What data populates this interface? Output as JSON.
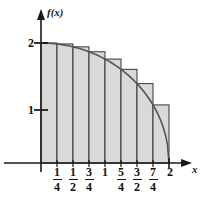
{
  "chart_data": {
    "type": "area",
    "title": "",
    "xlabel": "x",
    "ylabel": "f(x)",
    "xlim": [
      0,
      2.25
    ],
    "ylim": [
      0,
      2.3
    ],
    "grid": false,
    "legend": null,
    "function": "f(x) = sqrt(4 - x^2)",
    "curve": {
      "name": "f(x)",
      "color": "#555555",
      "x": [
        0,
        0.25,
        0.5,
        0.75,
        1,
        1.25,
        1.5,
        1.75,
        2
      ],
      "y": [
        2,
        1.984,
        1.936,
        1.854,
        1.732,
        1.561,
        1.323,
        0.968,
        0
      ]
    },
    "rectangles": {
      "name": "left-endpoint rectangles",
      "rule": "left",
      "n": 8,
      "width": 0.25,
      "fill": "#d9d9d9",
      "edge": "#333333",
      "left_edges": [
        0,
        0.25,
        0.5,
        0.75,
        1,
        1.25,
        1.5,
        1.75
      ],
      "heights": [
        2,
        1.984,
        1.936,
        1.854,
        1.732,
        1.561,
        1.323,
        0.968
      ]
    },
    "x_ticks": [
      {
        "value": 0.25,
        "label": "1/4",
        "num": "1",
        "den": "4"
      },
      {
        "value": 0.5,
        "label": "1/2",
        "num": "1",
        "den": "2"
      },
      {
        "value": 0.75,
        "label": "3/4",
        "num": "3",
        "den": "4"
      },
      {
        "value": 1,
        "label": "1"
      },
      {
        "value": 1.25,
        "label": "5/4",
        "num": "5",
        "den": "4"
      },
      {
        "value": 1.5,
        "label": "3/2",
        "num": "3",
        "den": "2"
      },
      {
        "value": 1.75,
        "label": "7/4",
        "num": "7",
        "den": "4"
      },
      {
        "value": 2,
        "label": "2"
      }
    ],
    "y_ticks": [
      {
        "value": 1,
        "label": "1"
      },
      {
        "value": 2,
        "label": "2"
      }
    ]
  },
  "labels": {
    "y_axis_title": "f(x)",
    "x_axis_title": "x",
    "ytick_2": "2",
    "ytick_1": "1",
    "xtick_1_num": "1",
    "xtick_1_den": "4",
    "xtick_2_num": "1",
    "xtick_2_den": "2",
    "xtick_3_num": "3",
    "xtick_3_den": "4",
    "xtick_4": "1",
    "xtick_5_num": "5",
    "xtick_5_den": "4",
    "xtick_6_num": "3",
    "xtick_6_den": "2",
    "xtick_7_num": "7",
    "xtick_7_den": "4",
    "xtick_8": "2"
  },
  "colors": {
    "axis": "#1a1a1a",
    "curve": "#555555",
    "rect_fill": "#d9d9d9",
    "rect_edge": "#3a3a3a",
    "text": "#111111",
    "background": "#ffffff"
  }
}
